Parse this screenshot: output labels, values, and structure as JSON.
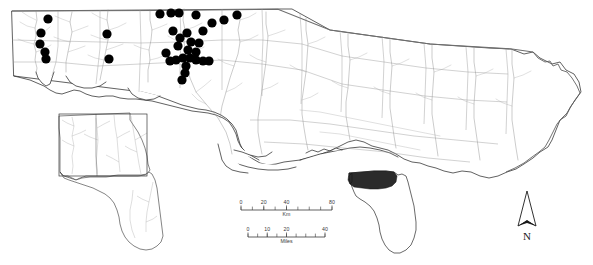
{
  "figure": {
    "type": "distribution-map",
    "region": "Florida Panhandle and adjacent Alabama / Georgia",
    "background_color": "#ffffff",
    "outline_color": "#1c1c1c",
    "river_color": "#8d8d8d",
    "county_color": "#9a9a9a",
    "point_color": "#000000",
    "shaded_color": "#2b2b2b"
  },
  "legend": {
    "symbol_name": "occurrence-point",
    "symbol_shape": "filled-circle",
    "symbol_color": "#000000"
  },
  "scale_bars": [
    {
      "name": "kilometers",
      "unit_label": "Km",
      "ticks": [
        0,
        20,
        40,
        80
      ],
      "labeled_ticks": [
        "0",
        "20",
        "40",
        "80"
      ],
      "minor_divisions": 8,
      "x_start": 241,
      "x_end": 332,
      "y": 210
    },
    {
      "name": "miles",
      "unit_label": "Miles",
      "ticks": [
        0,
        10,
        20,
        40
      ],
      "labeled_ticks": [
        "0",
        "10",
        "20",
        "40"
      ],
      "minor_divisions": 8,
      "x_start": 248,
      "x_end": 325,
      "y": 237
    }
  ],
  "north_arrow": {
    "name": "north-arrow",
    "label": "N",
    "x": 527,
    "y": 222
  },
  "inset_map": {
    "name": "regional-inset",
    "states_shown": [
      "Alabama",
      "Georgia",
      "Florida"
    ],
    "extent_box_shown": true
  },
  "locator_map": {
    "name": "florida-locator",
    "shaded_region": "Florida Panhandle",
    "shaded_color": "#2b2b2b"
  },
  "chart_data": {
    "type": "scatter",
    "title": "",
    "xlabel": "",
    "ylabel": "",
    "series": [
      {
        "name": "occurrence-points",
        "marker": "filled-circle",
        "color": "#000000",
        "count": 34,
        "points": [
          [
            48,
            19
          ],
          [
            41,
            33
          ],
          [
            40,
            44
          ],
          [
            45,
            52
          ],
          [
            46,
            59
          ],
          [
            107,
            34
          ],
          [
            109,
            59
          ],
          [
            160,
            14
          ],
          [
            171,
            13
          ],
          [
            179,
            13
          ],
          [
            196,
            15
          ],
          [
            173,
            31
          ],
          [
            187,
            33
          ],
          [
            191,
            42
          ],
          [
            188,
            50
          ],
          [
            183,
            58
          ],
          [
            186,
            66
          ],
          [
            185,
            73
          ],
          [
            182,
            80
          ],
          [
            176,
            60
          ],
          [
            170,
            61
          ],
          [
            196,
            60
          ],
          [
            203,
            61
          ],
          [
            209,
            61
          ],
          [
            199,
            43
          ],
          [
            203,
            31
          ],
          [
            212,
            23
          ],
          [
            224,
            20
          ],
          [
            237,
            15
          ],
          [
            196,
            52
          ],
          [
            190,
            58
          ],
          [
            178,
            46
          ],
          [
            180,
            38
          ],
          [
            166,
            53
          ]
        ]
      }
    ]
  }
}
